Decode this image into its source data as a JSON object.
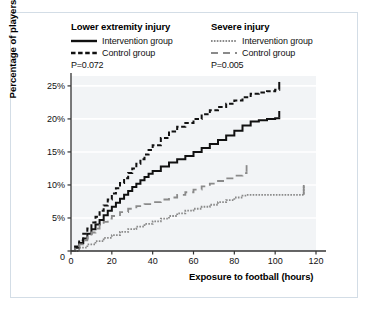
{
  "figure": {
    "border_color": "#d3dde6",
    "plot_bg": "#f2f4f6",
    "grid_color": "#ffffff",
    "axis_color": "#333333"
  },
  "legend": {
    "groups": [
      {
        "title": "Lower extremity injury",
        "entries": [
          {
            "label": "Intervention group",
            "style": "solid",
            "color": "#111111"
          },
          {
            "label": "Control group",
            "style": "dashed",
            "color": "#111111"
          }
        ],
        "p_value": "P=0.072"
      },
      {
        "title": "Severe injury",
        "entries": [
          {
            "label": "Intervention group",
            "style": "dotted",
            "color": "#8a8a8a"
          },
          {
            "label": "Control group",
            "style": "longdash",
            "color": "#8a8a8a"
          }
        ],
        "p_value": "P=0.005"
      }
    ]
  },
  "chart_data": {
    "type": "line",
    "title": "",
    "xlabel": "Exposure to football (hours)",
    "ylabel": "Percentage of players",
    "xlim": [
      0,
      120
    ],
    "ylim": [
      0,
      26.5
    ],
    "xticks": [
      0,
      20,
      40,
      60,
      80,
      100,
      120
    ],
    "xticklabels": [
      "0",
      "20",
      "40",
      "60",
      "80",
      "100",
      "120"
    ],
    "yticks": [
      0,
      5,
      10,
      15,
      20,
      25
    ],
    "yticklabels": [
      "0",
      "5%",
      "10%",
      "15%",
      "20%",
      "25%"
    ],
    "grid": "horizontal",
    "legend_position": "above-plot",
    "series": [
      {
        "name": "Lower extremity injury – Control group",
        "style": "dashed",
        "color": "#111111",
        "points": [
          [
            0,
            0
          ],
          [
            2,
            0.7
          ],
          [
            4,
            1.6
          ],
          [
            6,
            2.6
          ],
          [
            8,
            3.4
          ],
          [
            10,
            4.3
          ],
          [
            12,
            5.2
          ],
          [
            14,
            6.1
          ],
          [
            16,
            6.9
          ],
          [
            18,
            7.8
          ],
          [
            20,
            8.7
          ],
          [
            22,
            9.5
          ],
          [
            24,
            10.3
          ],
          [
            26,
            11.0
          ],
          [
            28,
            11.8
          ],
          [
            30,
            12.5
          ],
          [
            32,
            13.2
          ],
          [
            34,
            13.9
          ],
          [
            36,
            14.6
          ],
          [
            38,
            15.3
          ],
          [
            40,
            16.0
          ],
          [
            44,
            17.1
          ],
          [
            48,
            18.1
          ],
          [
            52,
            18.8
          ],
          [
            56,
            19.4
          ],
          [
            60,
            20.0
          ],
          [
            64,
            20.7
          ],
          [
            68,
            21.3
          ],
          [
            72,
            21.8
          ],
          [
            76,
            22.3
          ],
          [
            80,
            22.8
          ],
          [
            84,
            23.3
          ],
          [
            88,
            23.8
          ],
          [
            92,
            24.0
          ],
          [
            96,
            24.2
          ],
          [
            100,
            24.4
          ],
          [
            102,
            24.5
          ]
        ]
      },
      {
        "name": "Lower extremity injury – Intervention group",
        "style": "solid",
        "color": "#111111",
        "points": [
          [
            0,
            0
          ],
          [
            2,
            0.5
          ],
          [
            4,
            1.2
          ],
          [
            6,
            1.9
          ],
          [
            8,
            2.6
          ],
          [
            10,
            3.3
          ],
          [
            12,
            4.0
          ],
          [
            14,
            4.7
          ],
          [
            16,
            5.4
          ],
          [
            18,
            6.1
          ],
          [
            20,
            6.7
          ],
          [
            22,
            7.3
          ],
          [
            24,
            7.9
          ],
          [
            26,
            8.5
          ],
          [
            28,
            9.1
          ],
          [
            30,
            9.7
          ],
          [
            32,
            10.2
          ],
          [
            34,
            10.7
          ],
          [
            36,
            11.2
          ],
          [
            38,
            11.7
          ],
          [
            40,
            12.1
          ],
          [
            44,
            12.8
          ],
          [
            48,
            13.4
          ],
          [
            52,
            13.9
          ],
          [
            56,
            14.4
          ],
          [
            60,
            15.0
          ],
          [
            64,
            15.6
          ],
          [
            68,
            16.2
          ],
          [
            72,
            16.8
          ],
          [
            76,
            17.5
          ],
          [
            80,
            18.2
          ],
          [
            84,
            19.0
          ],
          [
            88,
            19.6
          ],
          [
            92,
            19.8
          ],
          [
            96,
            20.0
          ],
          [
            100,
            20.1
          ],
          [
            102,
            20.2
          ]
        ]
      },
      {
        "name": "Severe injury – Control group",
        "style": "longdash",
        "color": "#8a8a8a",
        "points": [
          [
            0,
            0
          ],
          [
            2,
            0.4
          ],
          [
            4,
            1.0
          ],
          [
            6,
            1.6
          ],
          [
            8,
            2.2
          ],
          [
            10,
            2.8
          ],
          [
            12,
            3.4
          ],
          [
            14,
            3.9
          ],
          [
            16,
            4.4
          ],
          [
            18,
            4.9
          ],
          [
            20,
            5.3
          ],
          [
            24,
            5.9
          ],
          [
            28,
            6.4
          ],
          [
            32,
            6.8
          ],
          [
            36,
            7.1
          ],
          [
            40,
            7.4
          ],
          [
            44,
            7.8
          ],
          [
            48,
            8.1
          ],
          [
            52,
            8.5
          ],
          [
            56,
            8.9
          ],
          [
            60,
            9.3
          ],
          [
            64,
            9.8
          ],
          [
            68,
            10.2
          ],
          [
            72,
            10.6
          ],
          [
            76,
            11.0
          ],
          [
            80,
            11.4
          ],
          [
            84,
            11.8
          ],
          [
            86,
            12.0
          ]
        ]
      },
      {
        "name": "Severe injury – Intervention group",
        "style": "dotted",
        "color": "#8a8a8a",
        "points": [
          [
            0,
            0
          ],
          [
            4,
            0.5
          ],
          [
            8,
            1.0
          ],
          [
            12,
            1.5
          ],
          [
            16,
            2.0
          ],
          [
            20,
            2.4
          ],
          [
            24,
            2.9
          ],
          [
            28,
            3.3
          ],
          [
            32,
            3.7
          ],
          [
            36,
            4.1
          ],
          [
            40,
            4.5
          ],
          [
            44,
            4.9
          ],
          [
            48,
            5.3
          ],
          [
            52,
            5.7
          ],
          [
            56,
            6.1
          ],
          [
            60,
            6.4
          ],
          [
            64,
            6.7
          ],
          [
            68,
            7.0
          ],
          [
            72,
            7.4
          ],
          [
            76,
            7.7
          ],
          [
            80,
            8.1
          ],
          [
            84,
            8.4
          ],
          [
            86,
            8.5
          ],
          [
            90,
            8.5
          ],
          [
            95,
            8.5
          ],
          [
            100,
            8.5
          ],
          [
            105,
            8.5
          ],
          [
            110,
            8.5
          ],
          [
            114,
            8.5
          ],
          [
            114,
            10.0
          ]
        ]
      }
    ],
    "series_terminal_ticks": [
      {
        "series": "Lower extremity injury – Control group",
        "x": 102,
        "y_from": 24.5,
        "y_to": 25.6
      },
      {
        "series": "Lower extremity injury – Intervention group",
        "x": 102,
        "y_from": 20.2,
        "y_to": 21.2
      },
      {
        "series": "Severe injury – Control group",
        "x": 86,
        "y_from": 12.0,
        "y_to": 13.0
      },
      {
        "series": "Severe injury – Intervention group",
        "x": 114,
        "y_from": 8.5,
        "y_to": 10.0
      }
    ]
  }
}
